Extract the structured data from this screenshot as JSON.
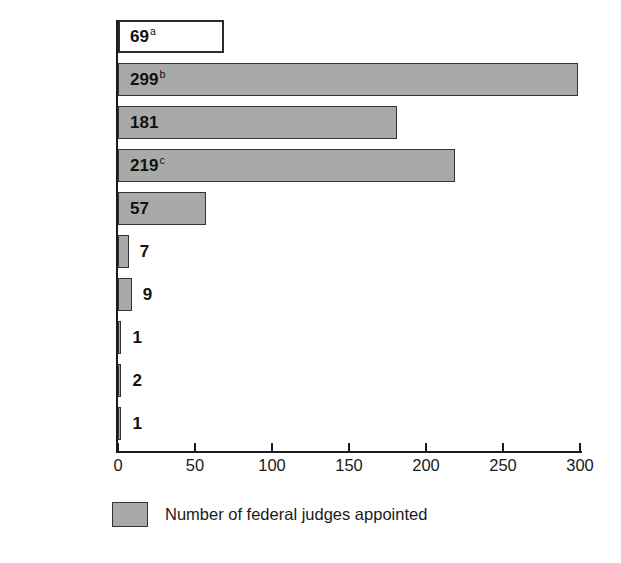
{
  "chart_data": {
    "type": "bar",
    "orientation": "horizontal",
    "title": "",
    "xlabel": "",
    "ylabel": "",
    "xlim": [
      0,
      300
    ],
    "xticks": [
      0,
      50,
      100,
      150,
      200,
      250,
      300
    ],
    "xtick_labels": [
      "0",
      "50",
      "100",
      "150",
      "200",
      "250",
      "300"
    ],
    "grid": false,
    "categories": [
      "Vacancies",
      "Clinton",
      "Bush",
      "Reagan",
      "Carter",
      "Ford",
      "Nixon",
      "Johnson",
      "Kennedy",
      "Eisenhower"
    ],
    "values": [
      69,
      299,
      181,
      219,
      57,
      7,
      9,
      1,
      2,
      1
    ],
    "data_labels": [
      "69",
      "299",
      "181",
      "219",
      "57",
      "7",
      "9",
      "1",
      "2",
      "1"
    ],
    "footnote_markers": [
      "a",
      "b",
      "",
      "c",
      "",
      "",
      "",
      "",
      "",
      ""
    ],
    "legend": {
      "position": "bottom",
      "entries": [
        {
          "label": "Number of federal judges appointed",
          "color": "#a9a9a9"
        }
      ]
    },
    "colors": {
      "bar_fill": "#a9a9a9",
      "bar_border": "#333333",
      "hollow_fill": "#ffffff",
      "hollow_border": "#2b2b2b",
      "text": "#1a1a1a",
      "axis": "#1a1a1a",
      "background": "#ffffff"
    },
    "rows": [
      {
        "category": "Vacancies",
        "value": 69,
        "label": "69",
        "marker": "a",
        "style": "hollow"
      },
      {
        "category": "Clinton",
        "value": 299,
        "label": "299",
        "marker": "b",
        "style": "filled"
      },
      {
        "category": "Bush",
        "value": 181,
        "label": "181",
        "marker": "",
        "style": "filled"
      },
      {
        "category": "Reagan",
        "value": 219,
        "label": "219",
        "marker": "c",
        "style": "filled"
      },
      {
        "category": "Carter",
        "value": 57,
        "label": "57",
        "marker": "",
        "style": "filled"
      },
      {
        "category": "Ford",
        "value": 7,
        "label": "7",
        "marker": "",
        "style": "filled"
      },
      {
        "category": "Nixon",
        "value": 9,
        "label": "9",
        "marker": "",
        "style": "filled"
      },
      {
        "category": "Johnson",
        "value": 1,
        "label": "1",
        "marker": "",
        "style": "filled"
      },
      {
        "category": "Kennedy",
        "value": 2,
        "label": "2",
        "marker": "",
        "style": "filled"
      },
      {
        "category": "Eisenhower",
        "value": 1,
        "label": "1",
        "marker": "",
        "style": "filled"
      }
    ]
  }
}
